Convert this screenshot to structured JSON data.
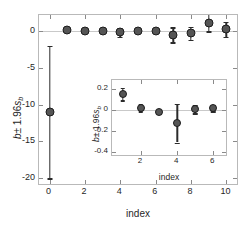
{
  "chart_data": {
    "type": "scatter",
    "title": "",
    "xlabel": "index",
    "ylabel": "b ± 1.96s_b",
    "xlim": [
      -0.6,
      10.6
    ],
    "ylim": [
      -20.8,
      2.2
    ],
    "xticks": [
      0,
      2,
      4,
      6,
      8,
      10
    ],
    "yticks": [
      0,
      -5,
      -10,
      -15,
      -20
    ],
    "xticklabels": [
      "0",
      "2",
      "4",
      "6",
      "8",
      "10"
    ],
    "yticklabels": [
      "0",
      "-5",
      "-10",
      "-15",
      "-20"
    ],
    "grid": false,
    "legend": null,
    "error_type": "95% confidence interval (±1.96 s_b)",
    "x": [
      0,
      1,
      2,
      3,
      4,
      5,
      6,
      7,
      8,
      9,
      10
    ],
    "values": [
      -11.0,
      0.16,
      0.03,
      -0.02,
      -0.13,
      0.01,
      0.02,
      -0.5,
      -0.3,
      1.1,
      0.25
    ],
    "errors": [
      9.0,
      0.25,
      0.2,
      0.1,
      0.6,
      0.2,
      0.2,
      1.0,
      0.9,
      1.1,
      1.0
    ],
    "annotations": [
      "inset magnifies indices 1 through 6"
    ],
    "inset": {
      "type": "scatter",
      "xlabel": "index",
      "ylabel": "b ± 1.96s_b",
      "xlim": [
        0.4,
        6.7
      ],
      "ylim": [
        -0.43,
        0.29
      ],
      "xticks": [
        2,
        4,
        6
      ],
      "yticks": [
        0.2,
        0,
        -0.2,
        -0.4
      ],
      "xticklabels": [
        "2",
        "4",
        "6"
      ],
      "yticklabels": [
        "0.2",
        "0",
        "-0.2",
        "-0.4"
      ],
      "grid": false,
      "x": [
        1,
        2,
        3,
        4,
        5,
        6
      ],
      "values": [
        0.155,
        0.025,
        -0.015,
        -0.125,
        0.01,
        0.02
      ],
      "errors": [
        0.06,
        0.035,
        0.018,
        0.185,
        0.04,
        0.032
      ]
    }
  },
  "labels": {
    "y_axis_symbol": "b",
    "y_axis_plusminus": "± 1.96",
    "y_axis_se": "s",
    "y_axis_se_sub": "b",
    "x_axis": "index"
  }
}
